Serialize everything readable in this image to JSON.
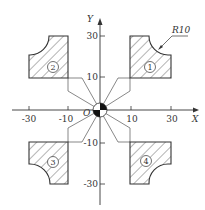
{
  "diagram": {
    "type": "coordinate-drawing",
    "axes": {
      "x_label": "X",
      "y_label": "Y",
      "origin_label": "O",
      "x_ticks": [
        "-30",
        "-10",
        "10",
        "30"
      ],
      "y_ticks": [
        "30",
        "10",
        "-10",
        "-30"
      ]
    },
    "annotation": {
      "radius_label": "R10"
    },
    "parts": [
      {
        "id": "1",
        "label": "①",
        "quadrant": "I"
      },
      {
        "id": "2",
        "label": "②",
        "quadrant": "II"
      },
      {
        "id": "3",
        "label": "③",
        "quadrant": "III"
      },
      {
        "id": "4",
        "label": "④",
        "quadrant": "IV"
      }
    ],
    "colors": {
      "stroke": "#333333",
      "background": "#ffffff"
    }
  }
}
